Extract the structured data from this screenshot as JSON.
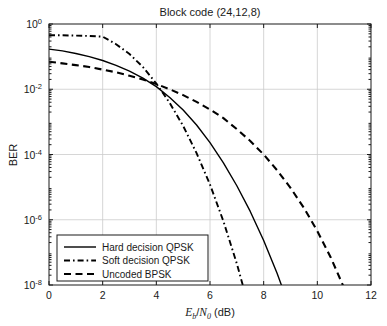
{
  "chart_data": {
    "type": "line",
    "title": "Block code (24,12,8)",
    "xlabel": "Eb/N0 (dB)",
    "xlabel_parts": {
      "base1": "E",
      "sub1": "b",
      "slash": "/",
      "base2": "N",
      "sub2": "0",
      "unit": " (dB)"
    },
    "ylabel": "BER",
    "xlim": [
      0,
      12
    ],
    "ylim": [
      1e-08,
      1
    ],
    "yscale": "log",
    "grid": true,
    "legend_position": "lower left",
    "xticks": [
      0,
      2,
      4,
      6,
      8,
      10,
      12
    ],
    "xtick_labels": [
      "0",
      "2",
      "4",
      "6",
      "8",
      "10",
      "12"
    ],
    "yticks": [
      1,
      0.01,
      0.0001,
      1e-06,
      1e-08
    ],
    "ytick_labels": [
      "10^0",
      "10^-2",
      "10^-4",
      "10^-6",
      "10^-8"
    ],
    "ytick_mantissa": [
      "10",
      "10",
      "10",
      "10",
      "10"
    ],
    "ytick_exponent": [
      "0",
      "-2",
      "-4",
      "-6",
      "-8"
    ],
    "x": [
      0,
      0.5,
      1,
      1.5,
      2,
      2.5,
      3,
      3.5,
      4,
      4.5,
      5,
      5.5,
      6,
      6.5,
      7,
      7.5,
      8,
      8.5,
      9,
      9.5,
      10,
      10.5,
      11,
      11.5,
      12
    ],
    "series": [
      {
        "name": "Hard decision QPSK",
        "style": "solid",
        "values": [
          0.17,
          0.15,
          0.125,
          0.1,
          0.076,
          0.054,
          0.036,
          0.022,
          0.012,
          0.0056,
          0.0023,
          0.0008,
          0.00023,
          5.5e-05,
          1.1e-05,
          1.8e-06,
          2.3e-07,
          2.3e-08,
          1.7e-09,
          1e-10,
          4e-12,
          1.2e-13,
          2.5e-15,
          3.5e-17,
          3.5e-19
        ]
      },
      {
        "name": "Soft decision QPSK",
        "style": "dashdot",
        "values": [
          0.45,
          0.45,
          0.44,
          0.43,
          0.41,
          0.24,
          0.12,
          0.048,
          0.015,
          0.0038,
          0.00075,
          0.00011,
          1.2e-05,
          9e-07,
          4.5e-08,
          1.5e-09,
          3e-11,
          4e-13,
          3e-15,
          1.5e-17,
          4e-20,
          6e-23,
          5e-26,
          2e-29,
          5e-33
        ]
      },
      {
        "name": "Uncoded BPSK",
        "style": "dashed",
        "values": [
          0.07,
          0.062,
          0.055,
          0.048,
          0.04,
          0.033,
          0.026,
          0.02,
          0.0145,
          0.01,
          0.0066,
          0.0041,
          0.0024,
          0.0013,
          0.0006,
          0.00026,
          0.0001,
          3.3e-05,
          9.5e-06,
          2.3e-06,
          4.5e-07,
          7e-08,
          8e-09,
          6.5e-10,
          3.5e-11
        ]
      }
    ]
  },
  "legend": {
    "items": [
      {
        "label": "Hard decision QPSK",
        "style": "solid"
      },
      {
        "label": "Soft decision QPSK",
        "style": "dashdot"
      },
      {
        "label": "Uncoded BPSK",
        "style": "dashed"
      }
    ]
  },
  "colors": {
    "background": "#ffffff",
    "axis": "#1a1a1a",
    "grid": "#cccccc",
    "series": "#000000"
  }
}
